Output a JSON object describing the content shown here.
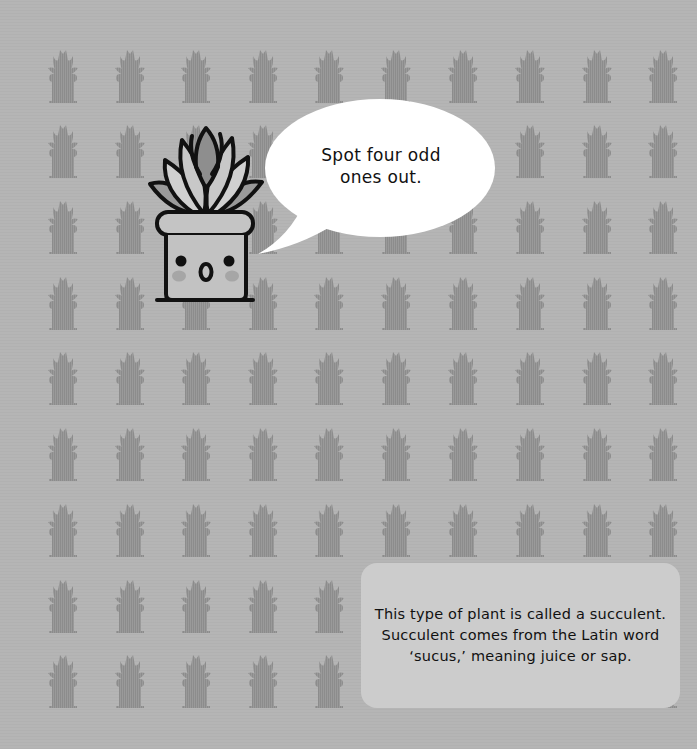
{
  "page": {
    "background_color": "#b5b5b5",
    "pattern_color": "#8c8c8c"
  },
  "pattern": {
    "icon": "potted-succulent-silhouette-icon",
    "columns": 10,
    "rows": 9,
    "col_x": [
      44,
      111,
      177,
      244,
      310,
      377,
      444,
      511,
      578,
      644
    ],
    "row_y": [
      48,
      123,
      199,
      275,
      350,
      426,
      502,
      578,
      653
    ],
    "odd_ones_out_count": 4
  },
  "mascot": {
    "icon": "surprised-succulent-pot-mascot-icon",
    "expression": "surprised"
  },
  "speech_bubble": {
    "line1": "Spot four odd",
    "line2": "ones out."
  },
  "info_box": {
    "line1": "This type of plant is called a succulent.",
    "line2": "Succulent comes from the Latin word",
    "line3": "‘sucus,’ meaning juice or sap.",
    "background_color": "#cccccc"
  }
}
